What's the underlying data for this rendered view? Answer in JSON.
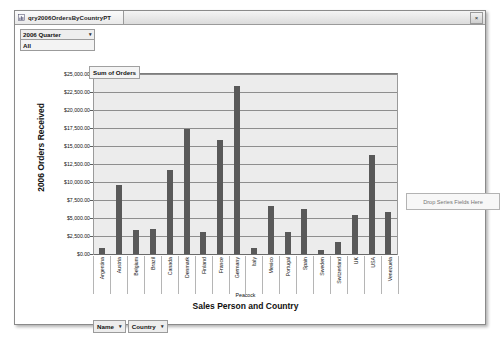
{
  "window": {
    "tab_title": "qry2006OrdersByCountryPT",
    "tab_icon": "pivotchart-icon",
    "close_label": "×"
  },
  "filter": {
    "field_label": "2006 Quarter",
    "selected_value": "All",
    "dropdown_arrow": "▾"
  },
  "series_legend": {
    "title": "Sum of Orders"
  },
  "drop_zone": {
    "label": "Drop Series Fields Here"
  },
  "field_buttons": [
    {
      "label": "Name",
      "arrow": "▾"
    },
    {
      "label": "Country",
      "arrow": "▾"
    }
  ],
  "chart_data": {
    "type": "bar",
    "title": "Sum of Orders",
    "xlabel": "Sales Person and Country",
    "ylabel": "2006 Orders Received",
    "group_label": "Peacock",
    "grid": true,
    "legend_position": "top-left",
    "ylim": [
      0,
      25000
    ],
    "ytick_step": 2500,
    "ytick_labels": [
      "$25,000.00",
      "$22,500.00",
      "$20,000.00",
      "$17,500.00",
      "$15,000.00",
      "$12,500.00",
      "$10,000.00",
      "$7,500.00",
      "$5,000.00",
      "$2,500.00",
      "$0.00"
    ],
    "ytick_values": [
      25000,
      22500,
      20000,
      17500,
      15000,
      12500,
      10000,
      7500,
      5000,
      2500,
      0
    ],
    "categories": [
      "Argentina",
      "Austria",
      "Belgium",
      "Brazil",
      "Canada",
      "Denmark",
      "Finland",
      "France",
      "Germany",
      "Italy",
      "Mexico",
      "Portugal",
      "Spain",
      "Sweden",
      "Switzerland",
      "UK",
      "USA",
      "Venezuela"
    ],
    "values": [
      800,
      9600,
      3400,
      3500,
      11700,
      17400,
      3100,
      15800,
      23300,
      900,
      6600,
      3000,
      6200,
      500,
      1700,
      5400,
      13700,
      5900
    ],
    "bar_color": "#595959",
    "plot_bg": "#ececec"
  }
}
